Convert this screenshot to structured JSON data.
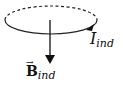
{
  "diagram": {
    "loop": {
      "shape": "ellipse",
      "back_half_style": "dashed",
      "front_half_style": "solid",
      "current_direction_arrow": "counterclockwise-at-front-right"
    },
    "field_vector": {
      "direction": "down"
    },
    "labels": {
      "current": {
        "main": "I",
        "subscript": "ind"
      },
      "field": {
        "main": "B",
        "subscript": "ind",
        "vector_arrow": "→"
      }
    },
    "colors": {
      "stroke": "#222222",
      "background": "#ffffff"
    }
  }
}
